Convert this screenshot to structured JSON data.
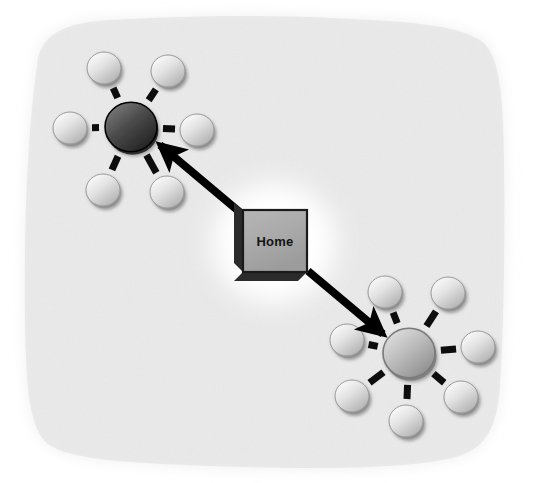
{
  "figure": {
    "type": "network-topology-diagram",
    "background_color": "#f0f0f0",
    "canvas_color": "#ffffff",
    "width": 535,
    "height": 483
  },
  "central_node": {
    "label": "Home",
    "shape": "3d-box",
    "face_color": "#a8a8a8",
    "edge_color": "#1a1a1a",
    "shadow_color": "#2b2b2b",
    "halo_color": "#ffffff",
    "x": 243,
    "y": 210,
    "width": 64,
    "height": 62
  },
  "clusters": [
    {
      "id": "cluster-upper-left",
      "name": "upper-left-cluster",
      "hub": {
        "name": "hub-dark",
        "cx": 131,
        "cy": 127,
        "r": 26,
        "fill_top": "#6e6e6e",
        "fill_bottom": "#2a2a2a",
        "rim_color": "#000000"
      },
      "satellite_count": 6,
      "satellite_radius": 17,
      "orbit_radius": 67,
      "satellite_fill_top": "#f2f2f2",
      "satellite_fill_bottom": "#b4b4b4",
      "satellite_rim": "#9a9a9a",
      "satellites": [
        {
          "name": "node-ul-1",
          "cx": 104,
          "cy": 68
        },
        {
          "name": "node-ul-2",
          "cx": 168,
          "cy": 71
        },
        {
          "name": "node-ul-3",
          "cx": 70,
          "cy": 128
        },
        {
          "name": "node-ul-4",
          "cx": 197,
          "cy": 130
        },
        {
          "name": "node-ul-5",
          "cx": 103,
          "cy": 190
        },
        {
          "name": "node-ul-6",
          "cx": 167,
          "cy": 192
        }
      ]
    },
    {
      "id": "cluster-lower-right",
      "name": "lower-right-cluster",
      "hub": {
        "name": "hub-gray",
        "cx": 409,
        "cy": 353,
        "r": 26,
        "fill_top": "#d2d2d2",
        "fill_bottom": "#8a8a8a",
        "rim_color": "#7a7a7a"
      },
      "satellite_count": 7,
      "satellite_radius": 17,
      "orbit_radius": 67,
      "satellite_fill_top": "#f2f2f2",
      "satellite_fill_bottom": "#b4b4b4",
      "satellite_rim": "#9a9a9a",
      "satellites": [
        {
          "name": "node-lr-1",
          "cx": 385,
          "cy": 292
        },
        {
          "name": "node-lr-2",
          "cx": 448,
          "cy": 293
        },
        {
          "name": "node-lr-3",
          "cx": 347,
          "cy": 340
        },
        {
          "name": "node-lr-4",
          "cx": 478,
          "cy": 347
        },
        {
          "name": "node-lr-5",
          "cx": 352,
          "cy": 396
        },
        {
          "name": "node-lr-6",
          "cx": 461,
          "cy": 397
        },
        {
          "name": "node-lr-7",
          "cx": 406,
          "cy": 421
        }
      ]
    }
  ],
  "spokes": {
    "color": "#0d0d0d",
    "width": 7,
    "inner_gap": 32,
    "outer_gap": 22
  },
  "arrows": [
    {
      "name": "arrow-home-to-upper-left",
      "from": "Home",
      "to": "hub-dark",
      "x1": 242,
      "y1": 214,
      "x2": 160,
      "y2": 145,
      "color": "#000000",
      "width": 8,
      "head": "end"
    },
    {
      "name": "arrow-home-to-lower-right",
      "from": "Home",
      "to": "hub-gray",
      "x1": 308,
      "y1": 271,
      "x2": 383,
      "y2": 334,
      "color": "#000000",
      "width": 8,
      "head": "end"
    }
  ]
}
